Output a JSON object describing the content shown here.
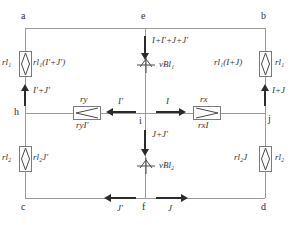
{
  "diagram": {
    "type": "electrical-circuit-schematic",
    "colors": {
      "wire": "#9a9a9a",
      "arrow": "#2b2b2b",
      "text": "#333333",
      "component_outline": "#7b7b7b",
      "background": "#ffffff"
    },
    "nodes": [
      {
        "id": "a",
        "label": "a",
        "x": 18,
        "y": 18
      },
      {
        "id": "e",
        "label": "e",
        "x": 145,
        "y": 18
      },
      {
        "id": "b",
        "label": "b",
        "x": 264,
        "y": 18
      },
      {
        "id": "h",
        "label": "h",
        "x": 18,
        "y": 113
      },
      {
        "id": "i",
        "label": "i",
        "x": 145,
        "y": 113
      },
      {
        "id": "j",
        "label": "j",
        "x": 264,
        "y": 113
      },
      {
        "id": "c",
        "label": "c",
        "x": 18,
        "y": 208
      },
      {
        "id": "f",
        "label": "f",
        "x": 145,
        "y": 208
      },
      {
        "id": "d",
        "label": "d",
        "x": 264,
        "y": 208
      }
    ],
    "components": [
      {
        "id": "rl1-left",
        "kind": "resistor",
        "branch": "a-h",
        "symbol_label": "rl₁",
        "value_label": "rl₁(I′+J′)"
      },
      {
        "id": "rl2-left",
        "kind": "resistor",
        "branch": "h-c",
        "symbol_label": "rl₂",
        "value_label": "rl₂J′"
      },
      {
        "id": "rl1-right",
        "kind": "resistor",
        "branch": "b-j",
        "symbol_label": "rl₁",
        "value_label": "rl₁(I+J)"
      },
      {
        "id": "rl2-right",
        "kind": "resistor",
        "branch": "j-d",
        "symbol_label": "rl₂",
        "value_label": "rl₂J"
      },
      {
        "id": "ry",
        "kind": "resistor-arrow",
        "branch": "h-i",
        "symbol_label": "ry",
        "value_label": "ryI′"
      },
      {
        "id": "rx",
        "kind": "resistor-arrow",
        "branch": "i-j",
        "symbol_label": "rx",
        "value_label": "rxI"
      },
      {
        "id": "vbl1",
        "kind": "emf-source",
        "branch": "e-i",
        "label": "vBl₁"
      },
      {
        "id": "vbl2",
        "kind": "emf-source",
        "branch": "i-f",
        "label": "vBl₂"
      }
    ],
    "currents": [
      {
        "id": "i-top-center",
        "label": "I+I′+J+J′",
        "direction": "down",
        "branch": "e-i"
      },
      {
        "id": "i-left-up",
        "label": "I′+J′",
        "direction": "up",
        "branch": "h-a"
      },
      {
        "id": "i-right-up",
        "label": "I+J",
        "direction": "up",
        "branch": "j-b"
      },
      {
        "id": "i-mid-left",
        "label": "I′",
        "direction": "left",
        "branch": "i-h"
      },
      {
        "id": "i-mid-right",
        "label": "I",
        "direction": "right",
        "branch": "i-j"
      },
      {
        "id": "i-center-down",
        "label": "J+J′",
        "direction": "down",
        "branch": "i-f"
      },
      {
        "id": "i-bottom-left",
        "label": "J′",
        "direction": "left",
        "branch": "f-c"
      },
      {
        "id": "i-bottom-right",
        "label": "J",
        "direction": "right",
        "branch": "f-d"
      }
    ]
  }
}
